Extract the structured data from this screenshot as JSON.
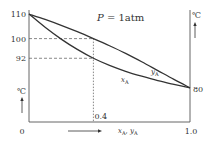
{
  "chart_data": {
    "type": "line",
    "title": "P = 1atm",
    "title_parts": {
      "var": "P",
      "rest": " = 1atm"
    },
    "xlabel": "xA, yA",
    "xlabel_parts": {
      "x": "x",
      "xsub": "A",
      "sep": ", ",
      "y": "y",
      "ysub": "A"
    },
    "ylabel_left": "℃",
    "ylabel_right": "℃",
    "xlim": [
      0,
      1.0
    ],
    "ylim": [
      80,
      110
    ],
    "x_ticks": [
      {
        "value": 0,
        "label": "0"
      },
      {
        "value": 0.4,
        "label": "0.4"
      },
      {
        "value": 1.0,
        "label": "1.0"
      }
    ],
    "y_ticks_left": [
      {
        "value": 110,
        "label": "110"
      },
      {
        "value": 100,
        "label": "100"
      },
      {
        "value": 92,
        "label": "92"
      }
    ],
    "y_ticks_right": [
      {
        "value": 80,
        "label": "80"
      }
    ],
    "series": [
      {
        "name": "yA",
        "label_main": "y",
        "label_sub": "A",
        "kind": "vapor",
        "points": [
          [
            0,
            110
          ],
          [
            0.1,
            107.8
          ],
          [
            0.2,
            105.4
          ],
          [
            0.3,
            102.8
          ],
          [
            0.4,
            100
          ],
          [
            0.5,
            97.1
          ],
          [
            0.6,
            94.0
          ],
          [
            0.7,
            90.6
          ],
          [
            0.8,
            87.0
          ],
          [
            0.9,
            83.4
          ],
          [
            1.0,
            80
          ]
        ]
      },
      {
        "name": "xA",
        "label_main": "x",
        "label_sub": "A",
        "kind": "liquid",
        "points": [
          [
            0,
            110
          ],
          [
            0.1,
            104.6
          ],
          [
            0.2,
            99.8
          ],
          [
            0.3,
            95.6
          ],
          [
            0.4,
            92
          ],
          [
            0.5,
            89.1
          ],
          [
            0.6,
            86.7
          ],
          [
            0.7,
            84.7
          ],
          [
            0.8,
            82.9
          ],
          [
            0.9,
            81.4
          ],
          [
            1.0,
            80
          ]
        ]
      }
    ],
    "reference_lines": [
      {
        "type": "h",
        "value": 100,
        "from_x": 0,
        "to_x": 0.4
      },
      {
        "type": "h",
        "value": 92,
        "from_x": 0,
        "to_x": 0.4
      },
      {
        "type": "v",
        "value": 0.4,
        "from_y": 100,
        "to_y": "axis"
      }
    ],
    "grid": false
  }
}
